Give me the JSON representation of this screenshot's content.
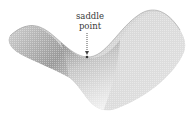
{
  "figure": {
    "annotation": {
      "line1": "saddle",
      "line2": "point"
    },
    "colors": {
      "surface_dark": "#6e6e6e",
      "surface_light": "#e6e6e6",
      "text": "#3a3a3a",
      "arrow": "#444444"
    }
  }
}
